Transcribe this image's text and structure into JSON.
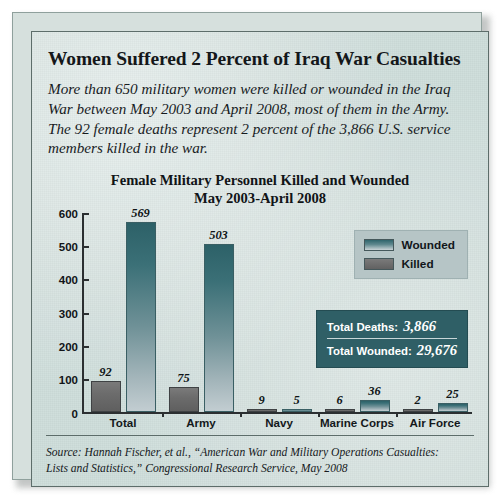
{
  "headline": "Women Suffered 2 Percent of Iraq War Casualties",
  "deck": "More than 650 military women were killed or wounded in the Iraq War between May 2003 and April 2008, most of them in the Army. The 92 female deaths represent 2 percent of the 3,866 U.S. service members killed in the war.",
  "chart_title_line1": "Female Military Personnel Killed and Wounded",
  "chart_title_line2": "May 2003-April 2008",
  "legend": {
    "wounded_label": "Wounded",
    "killed_label": "Killed",
    "wounded_color": "#2f656c",
    "killed_color": "#6c6c6c"
  },
  "totals": {
    "deaths_label": "Total Deaths:",
    "deaths_value": "3,866",
    "wounded_label": "Total Wounded:",
    "wounded_value": "29,676",
    "box_color": "#2f5f66"
  },
  "source": {
    "line1": "Source: Hannah Fischer, et al., “American War and Military Operations Casualties:",
    "line2": "Lists and Statistics,” Congressional Research Service, May 2008"
  },
  "chart_data": {
    "type": "bar",
    "title": "Female Military Personnel Killed and Wounded May 2003-April 2008",
    "xlabel": "",
    "ylabel": "",
    "ylim": [
      0,
      600
    ],
    "yticks": [
      0,
      100,
      200,
      300,
      400,
      500,
      600
    ],
    "ytick_labels": [
      "0",
      "100",
      "200",
      "300",
      "400",
      "500",
      "600"
    ],
    "grid": false,
    "legend_position": "top-right",
    "categories": [
      "Total",
      "Army",
      "Navy",
      "Marine Corps",
      "Air Force"
    ],
    "series": [
      {
        "name": "Killed",
        "color": "#6c6c6c",
        "values": [
          92,
          75,
          9,
          6,
          2
        ]
      },
      {
        "name": "Wounded",
        "color": "#2f656c",
        "values": [
          569,
          503,
          5,
          36,
          25
        ]
      }
    ]
  }
}
